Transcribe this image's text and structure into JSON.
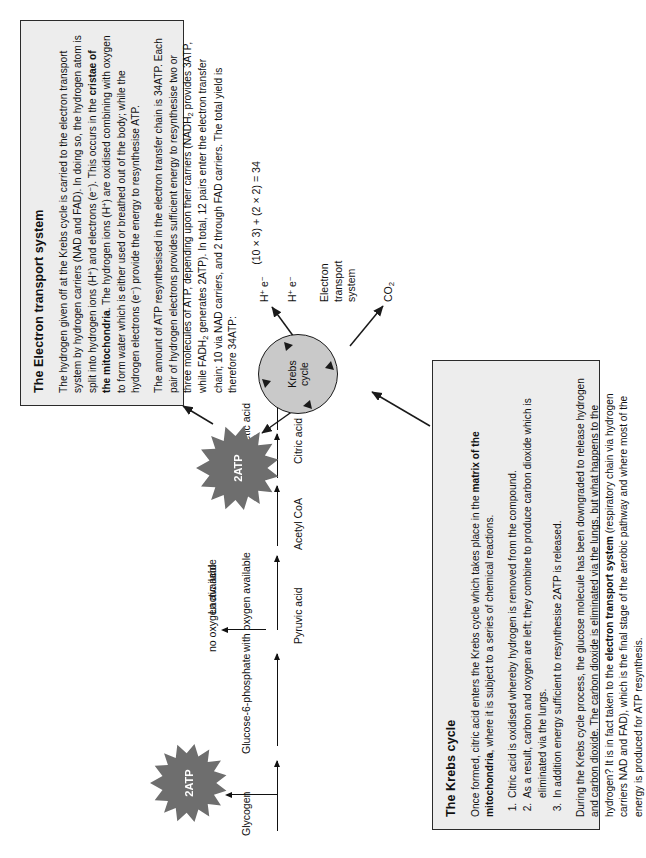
{
  "pathway": {
    "glycogen": "Glycogen",
    "glucose6phosphate": "Glucose-6-phosphate",
    "pyruvic_acid": "Pyruvic acid",
    "lactic_acid": "Lactic acid",
    "no_oxygen": "no oxygen available",
    "with_oxygen": "with oxygen available",
    "acetyl_coa": "Acetyl CoA",
    "oxaloacetic_acid": "Oxaloacetic acid",
    "citric_acid": "Citric acid",
    "atp_glycolysis": "2ATP",
    "atp_krebs": "2ATP",
    "krebs_circle_line1": "Krebs",
    "krebs_circle_line2": "cycle",
    "h_plus": "H",
    "h_plus_sup": "+",
    "e_minus": "e",
    "e_minus_sup": "−",
    "co2": "CO",
    "co2_sub": "2",
    "ets_label_line1": "Electron",
    "ets_label_line2": "transport",
    "ets_label_line3": "system"
  },
  "krebs_box": {
    "title": "The Krebs cycle",
    "intro_a": "Once formed, citric acid enters the Krebs cycle which takes place in the ",
    "intro_b": "matrix of the mitochondria",
    "intro_c": ", where it is subject to a series of chemical reactions.",
    "list": [
      "Citric acid is oxidised whereby hydrogen is removed from the compound.",
      "As a result, carbon and oxygen are left; they combine to produce carbon dioxide which is eliminated via the lungs.",
      "In addition energy sufficient to resynthesise 2ATP is released."
    ],
    "list_italic_word": "oxidised",
    "para2_a": "During the Krebs cycle process, the glucose molecule has been downgraded to release hydrogen and carbon dioxide. The carbon dioxide is eliminated via the lungs, but what happens to the hydrogen? It is in fact taken to the ",
    "para2_b": "electron transport system",
    "para2_c": " (respiratory chain via hydrogen carriers NAD and FAD), which is the final stage of the aerobic pathway and where most of the energy is produced for ATP resynthesis."
  },
  "ets_box": {
    "title": "The Electron transport system",
    "para1_a": "The hydrogen given off at the Krebs cycle is carried to the electron transport system by hydrogen carriers (NAD and FAD). In doing so, the hydrogen atom is split into hydrogen ions (H",
    "para1_b": "+",
    "para1_c": ") and electrons (e",
    "para1_d": "−",
    "para1_e": "). This occurs in the ",
    "para1_f": "cristae of the mitochondria",
    "para1_g": ". The hydrogen ions (H",
    "para1_h": "+",
    "para1_i": ") are oxidised combining with oxygen to form water which is either used or breathed out of the body; while the hydrogen electrons (e",
    "para1_j": "−",
    "para1_k": ") provide the energy to resynthesise ATP.",
    "para2_a": "The amount of ATP resynthesised in the electron transfer chain is 34ATP. Each pair of hydrogen electrons provides sufficient energy to resynthesise two or three molecules of ATP, depending upon their carriers (NADH",
    "para2_sub1": "2",
    "para2_b": " provides 3ATP, while FADH",
    "para2_sub2": "2",
    "para2_c": " generates 2ATP). In total, 12 pairs enter the electron transfer chain; 10 via NAD carriers, and 2 through FAD carriers. The total yield is therefore 34ATP:",
    "equation": "(10 × 3) + (2 × 2) = 34"
  },
  "colors": {
    "star_fill": "#6e6e6e",
    "circle_fill": "#c9c9c9",
    "box_fill": "#ededed",
    "stroke": "#1a1a1a"
  }
}
